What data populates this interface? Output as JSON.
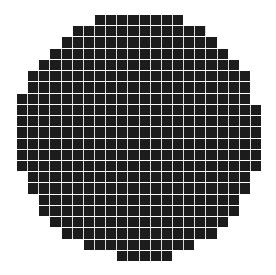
{
  "figure": {
    "grid": {
      "columns": 22,
      "rows": 22,
      "origin_x": 17,
      "origin_y": 15,
      "pitch_x": 11.14,
      "pitch_y": 11.23,
      "gap": 1
    },
    "colors": {
      "background": "#ffffff",
      "tile": "#1c1c1c",
      "grout": "#d9d9d9"
    },
    "rows": [
      {
        "row": 0,
        "start": 7,
        "end": 14
      },
      {
        "row": 1,
        "start": 5,
        "end": 16
      },
      {
        "row": 2,
        "start": 4,
        "end": 17
      },
      {
        "row": 3,
        "start": 3,
        "end": 18
      },
      {
        "row": 4,
        "start": 2,
        "end": 19
      },
      {
        "row": 5,
        "start": 1,
        "end": 20
      },
      {
        "row": 6,
        "start": 1,
        "end": 20
      },
      {
        "row": 7,
        "start": 0,
        "end": 20
      },
      {
        "row": 8,
        "start": 0,
        "end": 21
      },
      {
        "row": 9,
        "start": 0,
        "end": 21
      },
      {
        "row": 10,
        "start": 0,
        "end": 21
      },
      {
        "row": 11,
        "start": 0,
        "end": 21
      },
      {
        "row": 12,
        "start": 0,
        "end": 21
      },
      {
        "row": 13,
        "start": 0,
        "end": 21
      },
      {
        "row": 14,
        "start": 1,
        "end": 20
      },
      {
        "row": 15,
        "start": 1,
        "end": 20
      },
      {
        "row": 16,
        "start": 2,
        "end": 19
      },
      {
        "row": 17,
        "start": 2,
        "end": 19
      },
      {
        "row": 18,
        "start": 3,
        "end": 18
      },
      {
        "row": 19,
        "start": 4,
        "end": 17
      },
      {
        "row": 20,
        "start": 6,
        "end": 15
      },
      {
        "row": 21,
        "start": 9,
        "end": 13
      }
    ]
  }
}
